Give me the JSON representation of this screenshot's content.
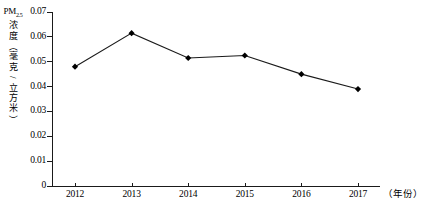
{
  "chart_data": {
    "type": "line",
    "title": "",
    "xlabel": "（年份）",
    "ylabel": "PM2.5浓度（毫克/立方米）",
    "ylabel_chars": [
      "浓",
      "度",
      "（",
      "毫",
      "克",
      "/",
      "立",
      "方",
      "米",
      "）"
    ],
    "ylabel_prefix": "PM",
    "ylabel_prefix_sub": "2.5",
    "categories": [
      "2012",
      "2013",
      "2014",
      "2015",
      "2016",
      "2017"
    ],
    "values": [
      0.048,
      0.0615,
      0.0515,
      0.0525,
      0.045,
      0.039
    ],
    "ylim": [
      0,
      0.07
    ],
    "ytick_labels": [
      "0",
      "0.01",
      "0.02",
      "0.03",
      "0.04",
      "0.05",
      "0.06",
      "0.07"
    ],
    "ytick_values": [
      0,
      0.01,
      0.02,
      0.03,
      0.04,
      0.05,
      0.06,
      0.07
    ],
    "grid": false,
    "legend": "none",
    "marker": "diamond",
    "line_color": "#1a1a1a",
    "marker_color": "#000000",
    "axis_color": "#1a1a1a",
    "background": "#ffffff"
  }
}
